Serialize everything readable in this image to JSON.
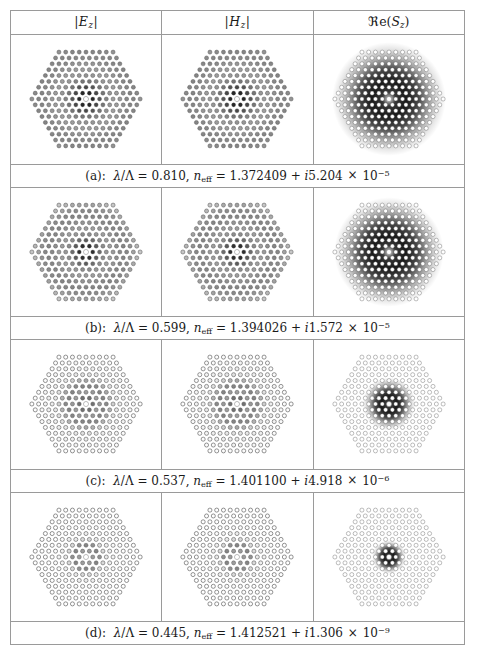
{
  "figure": {
    "type": "photonic-crystal-fiber-mode-field-table",
    "columns": [
      {
        "key": "Ez",
        "label": "|E_z|",
        "label_parts": {
          "bar_left": "|",
          "symbol": "E",
          "subscript": "z",
          "bar_right": "|"
        }
      },
      {
        "key": "Hz",
        "label": "|H_z|",
        "label_parts": {
          "bar_left": "|",
          "symbol": "H",
          "subscript": "z",
          "bar_right": "|"
        }
      },
      {
        "key": "ReSz",
        "label": "Re(S_z)",
        "label_parts": {
          "operator": "ℜ",
          "operator_tail": "e(",
          "symbol": "S",
          "subscript": "z",
          "close": ")"
        }
      }
    ],
    "rows": [
      {
        "tag": "(a)",
        "caption": "(a):  λ/Λ = 0.810, n_eff = 1.372409 + i5.204 × 10⁻⁵",
        "caption_parts": {
          "tag": "(a):",
          "lambda_ratio_label": "λ/Λ",
          "lambda_ratio_value": "0.810",
          "neff_label": "n",
          "neff_sub": "eff",
          "neff_real": "1.372409",
          "neff_imag_sign": "+",
          "neff_imag_unit": "i",
          "neff_imag_value": "5.204",
          "times": "×",
          "mantissa_base": "10",
          "mantissa_exp": "−5"
        },
        "lambda_over_Lambda": 0.81,
        "n_eff_real": 1.372409,
        "n_eff_imag": 5.204e-05,
        "confinement": "weak",
        "field_radius_frac": 0.72,
        "core_bright": true
      },
      {
        "tag": "(b)",
        "caption": "(b):  λ/Λ = 0.599, n_eff = 1.394026 + i1.572 × 10⁻⁵",
        "caption_parts": {
          "tag": "(b):",
          "lambda_ratio_label": "λ/Λ",
          "lambda_ratio_value": "0.599",
          "neff_label": "n",
          "neff_sub": "eff",
          "neff_real": "1.394026",
          "neff_imag_sign": "+",
          "neff_imag_unit": "i",
          "neff_imag_value": "1.572",
          "times": "×",
          "mantissa_base": "10",
          "mantissa_exp": "−5"
        },
        "lambda_over_Lambda": 0.599,
        "n_eff_real": 1.394026,
        "n_eff_imag": 1.572e-05,
        "confinement": "moderate",
        "field_radius_frac": 0.58,
        "core_bright": false
      },
      {
        "tag": "(c)",
        "caption": "(c):  λ/Λ = 0.537, n_eff = 1.401100 + i4.918 × 10⁻⁶",
        "caption_parts": {
          "tag": "(c):",
          "lambda_ratio_label": "λ/Λ",
          "lambda_ratio_value": "0.537",
          "neff_label": "n",
          "neff_sub": "eff",
          "neff_real": "1.401100",
          "neff_imag_sign": "+",
          "neff_imag_unit": "i",
          "neff_imag_value": "4.918",
          "times": "×",
          "mantissa_base": "10",
          "mantissa_exp": "−6"
        },
        "lambda_over_Lambda": 0.537,
        "n_eff_real": 1.4011,
        "n_eff_imag": 4.918e-06,
        "confinement": "strong",
        "field_radius_frac": 0.26,
        "core_bright": false
      },
      {
        "tag": "(d)",
        "caption": "(d):  λ/Λ = 0.445, n_eff = 1.412521 + i1.306 × 10⁻⁹",
        "caption_parts": {
          "tag": "(d):",
          "lambda_ratio_label": "λ/Λ",
          "lambda_ratio_value": "0.445",
          "neff_label": "n",
          "neff_sub": "eff",
          "neff_real": "1.412521",
          "neff_imag_sign": "+",
          "neff_imag_unit": "i",
          "neff_imag_value": "1.306",
          "times": "×",
          "mantissa_base": "10",
          "mantissa_exp": "−9"
        },
        "lambda_over_Lambda": 0.445,
        "n_eff_real": 1.412521,
        "n_eff_imag": 1.306e-09,
        "confinement": "very-strong",
        "field_radius_frac": 0.15,
        "core_bright": false
      }
    ],
    "lattice": {
      "geometry": "hexagonal",
      "rings": 8,
      "core_defect": "single-missing-hole-center",
      "hole_outline_color": "#555555",
      "background_color": "#ffffff",
      "field_color": "#000000"
    }
  }
}
